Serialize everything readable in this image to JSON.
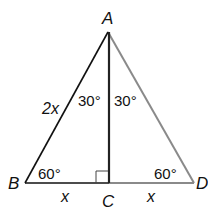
{
  "diagram": {
    "type": "geometry-triangle",
    "colors": {
      "left_lines": "#111111",
      "altitude": "#222222",
      "right_lines": "#8a8a8a",
      "background": "#ffffff"
    },
    "vertices": {
      "A": {
        "label": "A",
        "x": 108,
        "y": 32
      },
      "B": {
        "label": "B",
        "x": 25,
        "y": 183
      },
      "C": {
        "label": "C",
        "x": 109,
        "y": 183
      },
      "D": {
        "label": "D",
        "x": 194,
        "y": 183
      }
    },
    "angles": {
      "A_left": "30°",
      "A_right": "30°",
      "B": "60°",
      "D": "60°"
    },
    "sides": {
      "AB": "2x",
      "BC": "x",
      "CD": "x"
    },
    "right_angle_at": "C"
  }
}
